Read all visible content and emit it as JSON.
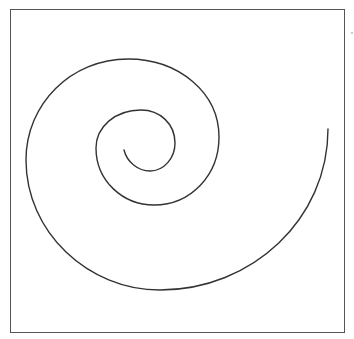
{
  "diagram": {
    "type": "spiral",
    "stroke_color": "#333333",
    "frame_color": "#555555",
    "background": "#ffffff",
    "spiral": {
      "start_point": [
        124,
        150
      ],
      "end_point": [
        328,
        129
      ],
      "turns": 2.25,
      "direction": "counterclockwise-outward"
    }
  }
}
